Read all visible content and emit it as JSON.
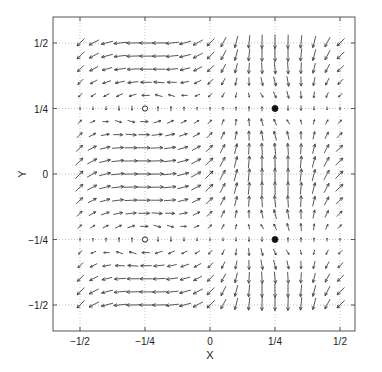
{
  "chart_data": {
    "type": "quiver",
    "title": "",
    "xlabel": "X",
    "ylabel": "Y",
    "xlim": [
      -0.56,
      0.56
    ],
    "ylim": [
      -0.56,
      0.56
    ],
    "grid": true,
    "grid_style": "dotted",
    "x_ticks": [
      -0.5,
      -0.25,
      0,
      0.25,
      0.5
    ],
    "x_tick_labels": [
      "−1/2",
      "−1/4",
      "0",
      "1/4",
      "1/2"
    ],
    "y_ticks": [
      -0.5,
      -0.25,
      0,
      0.25,
      0.5
    ],
    "y_tick_labels": [
      "−1/2",
      "−1/4",
      "0",
      "1/4",
      "1/2"
    ],
    "arrow_grid": {
      "x_start": -0.5,
      "x_end": 0.5,
      "y_start": -0.5,
      "y_end": 0.5,
      "step": 0.05,
      "field_description": "u = cos(2πy)·(0.5 − 0.5·sin(2πx)), v = cos(2πy)·(0.5 + 0.5·sin(2πx)) plus local circulation around stagnation points (approximation)"
    },
    "markers": [
      {
        "x": -0.25,
        "y": 0.25,
        "style": "hollow-circle"
      },
      {
        "x": -0.25,
        "y": -0.25,
        "style": "hollow-circle"
      },
      {
        "x": 0.25,
        "y": 0.25,
        "style": "filled-circle"
      },
      {
        "x": 0.25,
        "y": -0.25,
        "style": "filled-circle"
      }
    ],
    "arrow_color": "#444444",
    "axis_color": "#555555",
    "grid_color": "#aaaaaa"
  }
}
